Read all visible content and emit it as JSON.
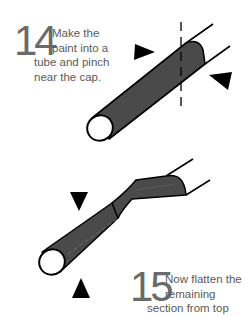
{
  "steps": [
    {
      "number": "14",
      "lines": [
        "Make the",
        "paint into a",
        "tube and pinch",
        "near the cap."
      ]
    },
    {
      "number": "15",
      "lines": [
        "Now flatten the",
        "remaining",
        "section from top"
      ]
    }
  ],
  "colors": {
    "tube_fill": "#4a4a4a",
    "outline": "#000000",
    "text": "#5a5a5a",
    "background": "#ffffff"
  },
  "icons": {
    "arrow_marker": "solid-triangle",
    "cut_guide": "dashed-line"
  }
}
